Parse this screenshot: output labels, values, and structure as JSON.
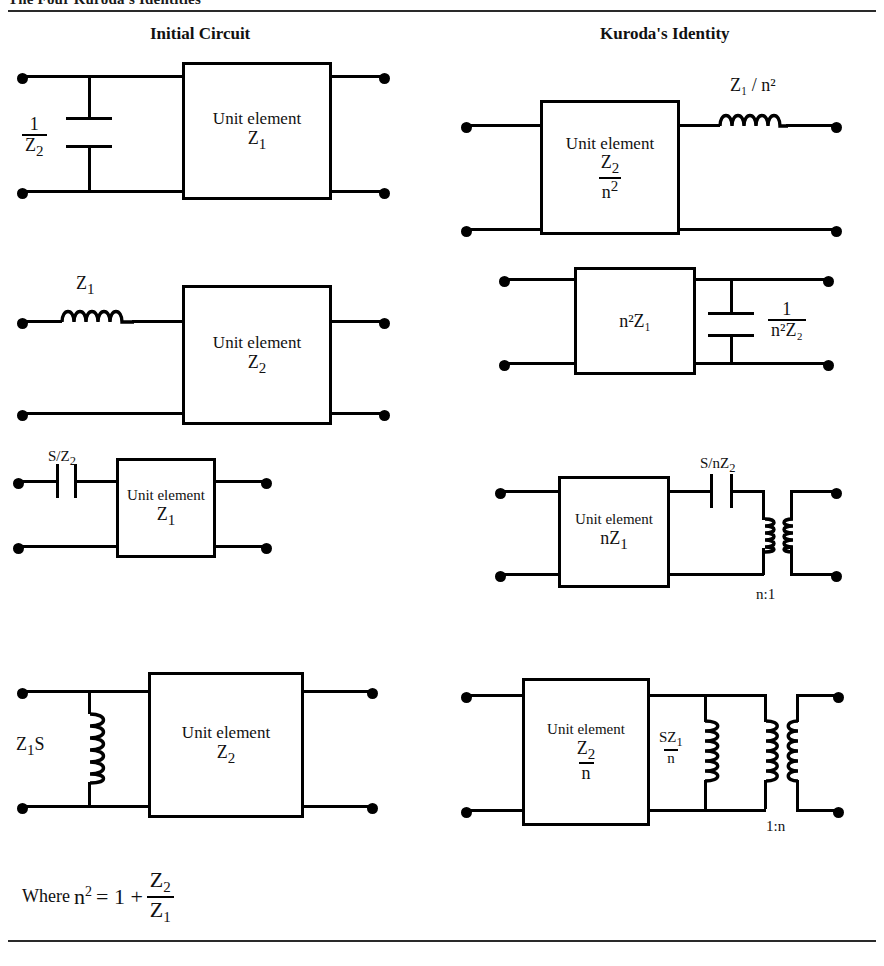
{
  "document": {
    "title": "The Four Kuroda's Identities",
    "columns": {
      "left": "Initial Circuit",
      "right": "Kuroda's Identity"
    },
    "footnote": {
      "prefix": "Where",
      "variable": "n",
      "exponent": "2",
      "equals": "= 1 +",
      "num": "Z",
      "num_sub": "2",
      "den": "Z",
      "den_sub": "1"
    }
  },
  "labels": {
    "unit_element": "Unit element"
  },
  "identities": [
    {
      "id": "identity-1",
      "initial": {
        "shunt_element": "capacitor",
        "shunt_label_num": "1",
        "shunt_label_den": "Z",
        "shunt_label_den_sub": "2",
        "box_title": "Unit element",
        "box_value": "Z",
        "box_value_sub": "1"
      },
      "kuroda": {
        "box_title": "Unit element",
        "box_num": "Z",
        "box_num_sub": "2",
        "box_den": "n",
        "box_den_sup": "2",
        "series_element": "inductor",
        "series_label": "Z₁ / n²"
      }
    },
    {
      "id": "identity-2",
      "initial": {
        "series_element": "inductor",
        "series_label": "Z",
        "series_label_sub": "1",
        "box_title": "Unit element",
        "box_value": "Z",
        "box_value_sub": "2"
      },
      "kuroda": {
        "box_value": "n²Z₁",
        "shunt_element": "capacitor",
        "shunt_label_num": "1",
        "shunt_label_den": "n²Z₂"
      }
    },
    {
      "id": "identity-3",
      "initial": {
        "series_element": "capacitor",
        "series_label": "S/Z",
        "series_label_sub": "2",
        "box_title": "Unit element",
        "box_value": "Z",
        "box_value_sub": "1"
      },
      "kuroda": {
        "box_title": "Unit element",
        "box_value": "nZ",
        "box_value_sub": "1",
        "series_element": "capacitor",
        "series_label": "S/nZ",
        "series_label_sub": "2",
        "transformer": "n:1"
      }
    },
    {
      "id": "identity-4",
      "initial": {
        "shunt_element": "inductor",
        "shunt_label": "Z",
        "shunt_label_sub": "1",
        "shunt_label_tail": "S",
        "box_title": "Unit element",
        "box_value": "Z",
        "box_value_sub": "2"
      },
      "kuroda": {
        "box_title": "Unit element",
        "box_num": "Z",
        "box_num_sub": "2",
        "box_den": "n",
        "shunt_element": "inductor",
        "shunt_label_num": "SZ",
        "shunt_label_num_sub": "1",
        "shunt_label_den": "n",
        "transformer": "1:n"
      }
    }
  ]
}
